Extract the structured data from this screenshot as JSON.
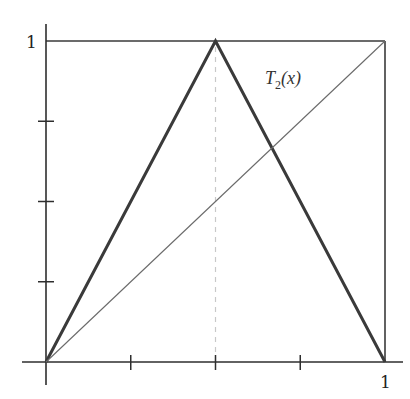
{
  "chart_data": {
    "type": "line",
    "title": "",
    "xlabel": "",
    "ylabel": "",
    "xlim": [
      0,
      1
    ],
    "ylim": [
      0,
      1
    ],
    "grid": false,
    "legend": null,
    "x_ticks": [
      0,
      0.25,
      0.5,
      0.75,
      1
    ],
    "y_ticks": [
      0,
      0.25,
      0.5,
      0.75,
      1
    ],
    "x_tick_labels": {
      "1": "1"
    },
    "y_tick_labels": {
      "1": "1"
    },
    "series": [
      {
        "name": "T_2(x)",
        "style": "thick-dark",
        "x": [
          0,
          0.5,
          1
        ],
        "y": [
          0,
          1,
          0
        ]
      },
      {
        "name": "y = x",
        "style": "thin",
        "x": [
          0,
          1
        ],
        "y": [
          0,
          1
        ]
      }
    ],
    "reference_lines": [
      {
        "type": "vertical",
        "x": 0.5,
        "y_range": [
          0,
          1
        ],
        "style": "dashed-light"
      },
      {
        "type": "horizontal",
        "y": 1,
        "x_range": [
          0,
          1
        ],
        "style": "box"
      },
      {
        "type": "vertical",
        "x": 1,
        "y_range": [
          0,
          1
        ],
        "style": "box"
      }
    ],
    "annotations": [
      {
        "text": "T",
        "subscript": "2",
        "suffix": "(x)",
        "x": 0.65,
        "y": 0.87
      }
    ]
  },
  "labels": {
    "y_one": "1",
    "x_one": "1",
    "curve_main": "T",
    "curve_sub": "2",
    "curve_arg": "(x)"
  },
  "colors": {
    "tent": "#3a3a3a",
    "diagonal": "#6a6a6a",
    "axis": "#2e2e2e",
    "box": "#3a3a3a",
    "dashed": "#c8c8c8"
  }
}
